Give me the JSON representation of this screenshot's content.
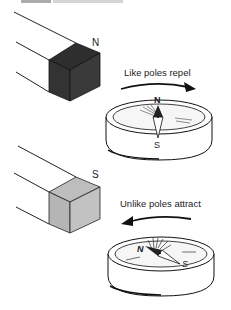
{
  "header": {
    "title_fragment": "ELECTROMAGNETISM"
  },
  "panels": [
    {
      "magnet_pole": "N",
      "magnet_color": "#333333",
      "caption": "Like poles repel",
      "arrow_direction": "right",
      "compass": {
        "north_label": "N",
        "south_label": "S"
      }
    },
    {
      "magnet_pole": "S",
      "magnet_color": "#b8b8b8",
      "caption": "Unlike poles attract",
      "arrow_direction": "left",
      "compass": {
        "north_label": "N",
        "south_label": "S"
      }
    }
  ]
}
